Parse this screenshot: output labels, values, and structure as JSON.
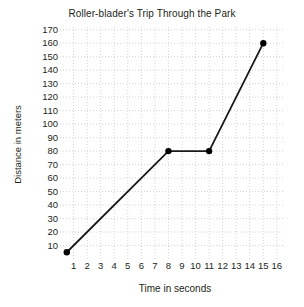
{
  "chart_data": {
    "type": "line",
    "title": "Roller-blader's Trip Through the Park",
    "xlabel": "Time in seconds",
    "ylabel": "Distance in meters",
    "xlim": [
      0,
      16.6
    ],
    "ylim": [
      0,
      172
    ],
    "xticks": [
      1,
      2,
      3,
      4,
      5,
      6,
      7,
      8,
      9,
      10,
      11,
      12,
      13,
      14,
      15,
      16
    ],
    "yticks": [
      10,
      20,
      30,
      40,
      50,
      60,
      70,
      80,
      90,
      100,
      110,
      120,
      130,
      140,
      150,
      160,
      170
    ],
    "grid": "dotted",
    "grid_color": "#c9c9c9",
    "legend": "none",
    "line_color": "#1a1a1a",
    "marker": "circle",
    "marker_color": "#000000",
    "x": [
      0.5,
      8,
      11,
      15
    ],
    "values": [
      5,
      80,
      80,
      160
    ],
    "points": [
      {
        "x": 0.5,
        "y": 5
      },
      {
        "x": 8,
        "y": 80
      },
      {
        "x": 11,
        "y": 80
      },
      {
        "x": 15,
        "y": 160
      }
    ]
  }
}
